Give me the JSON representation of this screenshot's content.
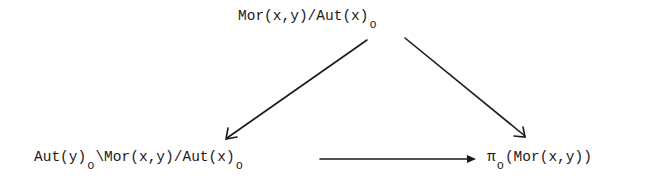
{
  "diagram": {
    "type": "commutative-triangle",
    "nodes": {
      "top": {
        "main": "Mor(x,y)/Aut(x)",
        "subscript": "o"
      },
      "bottom_left": {
        "part1": "Aut(y)",
        "sub1": "o",
        "part2": "\\Mor(x,y)/Aut(x)",
        "sub2": "o"
      },
      "bottom_right": {
        "symbol": "π",
        "sub": "o",
        "rest": "(Mor(x,y))"
      }
    },
    "edges": [
      {
        "from": "top",
        "to": "bottom_left"
      },
      {
        "from": "top",
        "to": "bottom_right"
      },
      {
        "from": "bottom_left",
        "to": "bottom_right"
      }
    ],
    "colors": {
      "ink": "#1a1a1a",
      "background": "#ffffff"
    }
  }
}
